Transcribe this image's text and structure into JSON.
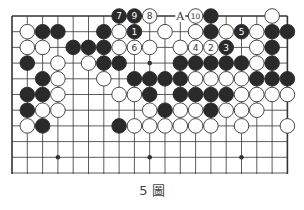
{
  "diagram": {
    "type": "go-board-diagram",
    "columns": 19,
    "rows_visible": 11,
    "grid": {
      "left": 12,
      "top": 16,
      "spacing_x": 15.3,
      "spacing_y": 15.7,
      "bottom": 174
    },
    "hoshi": [
      [
        3,
        3
      ],
      [
        9,
        3
      ],
      [
        15,
        3
      ],
      [
        3,
        9
      ],
      [
        9,
        9
      ],
      [
        15,
        9
      ]
    ],
    "colors": {
      "black": "#2a2a2a",
      "white": "#ffffff",
      "line": "#333333"
    },
    "stones": [
      {
        "c": 7,
        "r": 0,
        "color": "B",
        "label": "7"
      },
      {
        "c": 8,
        "r": 0,
        "color": "B",
        "label": "9"
      },
      {
        "c": 9,
        "r": 0,
        "color": "W",
        "label": "8"
      },
      {
        "c": 12,
        "r": 0,
        "color": "W",
        "label": "10"
      },
      {
        "c": 13,
        "r": 0,
        "color": "B"
      },
      {
        "c": 17,
        "r": 0,
        "color": "W"
      },
      {
        "c": 1,
        "r": 1,
        "color": "W"
      },
      {
        "c": 2,
        "r": 1,
        "color": "B"
      },
      {
        "c": 3,
        "r": 1,
        "color": "B"
      },
      {
        "c": 6,
        "r": 1,
        "color": "B"
      },
      {
        "c": 7,
        "r": 1,
        "color": "W"
      },
      {
        "c": 8,
        "r": 1,
        "color": "B",
        "label": "1"
      },
      {
        "c": 10,
        "r": 1,
        "color": "W"
      },
      {
        "c": 12,
        "r": 1,
        "color": "W"
      },
      {
        "c": 13,
        "r": 1,
        "color": "B"
      },
      {
        "c": 14,
        "r": 1,
        "color": "W"
      },
      {
        "c": 15,
        "r": 1,
        "color": "B",
        "label": "5"
      },
      {
        "c": 16,
        "r": 1,
        "color": "W"
      },
      {
        "c": 17,
        "r": 1,
        "color": "B"
      },
      {
        "c": 18,
        "r": 1,
        "color": "B"
      },
      {
        "c": 1,
        "r": 2,
        "color": "W"
      },
      {
        "c": 2,
        "r": 2,
        "color": "W"
      },
      {
        "c": 4,
        "r": 2,
        "color": "B"
      },
      {
        "c": 5,
        "r": 2,
        "color": "B"
      },
      {
        "c": 6,
        "r": 2,
        "color": "B"
      },
      {
        "c": 7,
        "r": 2,
        "color": "W"
      },
      {
        "c": 8,
        "r": 2,
        "color": "W",
        "label": "6"
      },
      {
        "c": 9,
        "r": 2,
        "color": "W"
      },
      {
        "c": 11,
        "r": 2,
        "color": "W"
      },
      {
        "c": 12,
        "r": 2,
        "color": "W",
        "label": "4"
      },
      {
        "c": 13,
        "r": 2,
        "color": "W",
        "label": "2"
      },
      {
        "c": 14,
        "r": 2,
        "color": "B",
        "label": "3"
      },
      {
        "c": 16,
        "r": 2,
        "color": "W"
      },
      {
        "c": 17,
        "r": 2,
        "color": "B"
      },
      {
        "c": 1,
        "r": 3,
        "color": "B"
      },
      {
        "c": 3,
        "r": 3,
        "color": "W"
      },
      {
        "c": 5,
        "r": 3,
        "color": "W"
      },
      {
        "c": 6,
        "r": 3,
        "color": "B"
      },
      {
        "c": 7,
        "r": 3,
        "color": "B"
      },
      {
        "c": 11,
        "r": 3,
        "color": "B"
      },
      {
        "c": 12,
        "r": 3,
        "color": "B"
      },
      {
        "c": 13,
        "r": 3,
        "color": "B"
      },
      {
        "c": 14,
        "r": 3,
        "color": "B"
      },
      {
        "c": 15,
        "r": 3,
        "color": "B"
      },
      {
        "c": 16,
        "r": 3,
        "color": "W"
      },
      {
        "c": 17,
        "r": 3,
        "color": "B"
      },
      {
        "c": 2,
        "r": 4,
        "color": "B"
      },
      {
        "c": 3,
        "r": 4,
        "color": "W"
      },
      {
        "c": 6,
        "r": 4,
        "color": "W"
      },
      {
        "c": 8,
        "r": 4,
        "color": "B"
      },
      {
        "c": 9,
        "r": 4,
        "color": "B"
      },
      {
        "c": 10,
        "r": 4,
        "color": "B"
      },
      {
        "c": 11,
        "r": 4,
        "color": "B"
      },
      {
        "c": 12,
        "r": 4,
        "color": "W"
      },
      {
        "c": 13,
        "r": 4,
        "color": "W"
      },
      {
        "c": 14,
        "r": 4,
        "color": "W"
      },
      {
        "c": 15,
        "r": 4,
        "color": "W"
      },
      {
        "c": 16,
        "r": 4,
        "color": "B"
      },
      {
        "c": 17,
        "r": 4,
        "color": "B"
      },
      {
        "c": 18,
        "r": 4,
        "color": "B"
      },
      {
        "c": 1,
        "r": 5,
        "color": "B"
      },
      {
        "c": 2,
        "r": 5,
        "color": "B"
      },
      {
        "c": 3,
        "r": 5,
        "color": "W"
      },
      {
        "c": 7,
        "r": 5,
        "color": "W"
      },
      {
        "c": 8,
        "r": 5,
        "color": "W"
      },
      {
        "c": 9,
        "r": 5,
        "color": "B"
      },
      {
        "c": 11,
        "r": 5,
        "color": "B"
      },
      {
        "c": 12,
        "r": 5,
        "color": "B"
      },
      {
        "c": 13,
        "r": 5,
        "color": "B"
      },
      {
        "c": 14,
        "r": 5,
        "color": "B"
      },
      {
        "c": 15,
        "r": 5,
        "color": "W"
      },
      {
        "c": 16,
        "r": 5,
        "color": "W"
      },
      {
        "c": 17,
        "r": 5,
        "color": "W"
      },
      {
        "c": 18,
        "r": 5,
        "color": "W"
      },
      {
        "c": 1,
        "r": 6,
        "color": "B"
      },
      {
        "c": 2,
        "r": 6,
        "color": "W"
      },
      {
        "c": 3,
        "r": 6,
        "color": "W"
      },
      {
        "c": 9,
        "r": 6,
        "color": "W"
      },
      {
        "c": 10,
        "r": 6,
        "color": "B"
      },
      {
        "c": 11,
        "r": 6,
        "color": "W"
      },
      {
        "c": 12,
        "r": 6,
        "color": "W"
      },
      {
        "c": 13,
        "r": 6,
        "color": "B"
      },
      {
        "c": 14,
        "r": 6,
        "color": "W"
      },
      {
        "c": 15,
        "r": 6,
        "color": "W"
      },
      {
        "c": 16,
        "r": 6,
        "color": "W"
      },
      {
        "c": 1,
        "r": 7,
        "color": "W"
      },
      {
        "c": 2,
        "r": 7,
        "color": "B"
      },
      {
        "c": 7,
        "r": 7,
        "color": "B"
      },
      {
        "c": 8,
        "r": 7,
        "color": "W"
      },
      {
        "c": 9,
        "r": 7,
        "color": "W"
      },
      {
        "c": 10,
        "r": 7,
        "color": "W"
      },
      {
        "c": 11,
        "r": 7,
        "color": "W"
      },
      {
        "c": 12,
        "r": 7,
        "color": "W"
      },
      {
        "c": 13,
        "r": 7,
        "color": "W"
      },
      {
        "c": 15,
        "r": 7,
        "color": "W"
      },
      {
        "c": 18,
        "r": 7,
        "color": "W"
      }
    ],
    "markers": [
      {
        "c": 11,
        "r": 0,
        "label": "A"
      }
    ]
  },
  "caption": "5 圖"
}
